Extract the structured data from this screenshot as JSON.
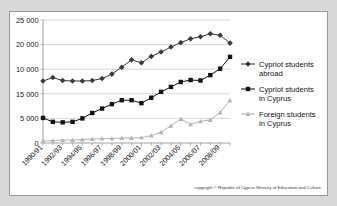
{
  "figure": {
    "background_color": "#ffffff",
    "page_background_color": "#d9d9d9",
    "border_color": "#9a9a9a"
  },
  "credit": {
    "text": "copyright © Republic of Cyprus Ministry of Education and Culture"
  },
  "legend": {
    "position": "right",
    "entries": [
      {
        "label_line1": "Cypriot students",
        "label_line2": "abroad",
        "color": "#3a3a3a",
        "marker": "diamond"
      },
      {
        "label_line1": "Cypriot students",
        "label_line2": "in Cyprus",
        "color": "#141414",
        "marker": "square"
      },
      {
        "label_line1": "Foreign students",
        "label_line2": "in Cyprus",
        "color": "#b4b4b4",
        "marker": "triangle"
      }
    ]
  },
  "chart_data": {
    "type": "line",
    "title": "",
    "xlabel": "",
    "ylabel": "",
    "ylim": [
      0,
      25000
    ],
    "grid": true,
    "y_ticks": [
      0,
      5000,
      10000,
      15000,
      20000,
      25000
    ],
    "y_tick_labels_as_printed": [
      "0",
      "5 000",
      "15 000",
      "10 000",
      "20 000",
      "25 000"
    ],
    "y_tick_label_note": "The printed labels for 10 000 and 15 000 are transposed in the original graphic; positions top-to-bottom read 25 000, 20 000, 10 000, 15 000, 5 000, 0.",
    "x": [
      "1990/91",
      "1991/92",
      "1992/93",
      "1993/94",
      "1994/95",
      "1995/96",
      "1996/97",
      "1997/98",
      "1998/99",
      "1999/00",
      "2000/01",
      "2001/02",
      "2002/03",
      "2003/04",
      "2004/05",
      "2005/06",
      "2006/07",
      "2007/08",
      "2008/09",
      "2009/10"
    ],
    "x_tick_labels": [
      "1990/91",
      "1992/93",
      "1994/95",
      "1996/97",
      "1998/99",
      "2000/01",
      "2002/03",
      "2004/05",
      "2006/07",
      "2008/09"
    ],
    "series": [
      {
        "name": "Cypriot students abroad",
        "color": "#3a3a3a",
        "marker": "diamond",
        "values": [
          12600,
          13300,
          12700,
          12600,
          12600,
          12700,
          13100,
          14000,
          15400,
          16900,
          16300,
          17600,
          18500,
          19500,
          20400,
          21200,
          21600,
          22200,
          21900,
          20300
        ]
      },
      {
        "name": "Cypriot students in Cyprus",
        "color": "#141414",
        "marker": "square",
        "values": [
          5100,
          4300,
          4200,
          4300,
          5000,
          6100,
          7000,
          7900,
          8700,
          8700,
          8100,
          9200,
          10400,
          11400,
          12400,
          12800,
          12700,
          13800,
          15100,
          17500
        ]
      },
      {
        "name": "Foreign students in Cyprus",
        "color": "#b4b4b4",
        "marker": "triangle",
        "values": [
          400,
          500,
          600,
          600,
          700,
          800,
          900,
          900,
          1000,
          1000,
          1100,
          1500,
          2200,
          3500,
          4900,
          3800,
          4400,
          4700,
          6200,
          8700
        ]
      }
    ]
  }
}
